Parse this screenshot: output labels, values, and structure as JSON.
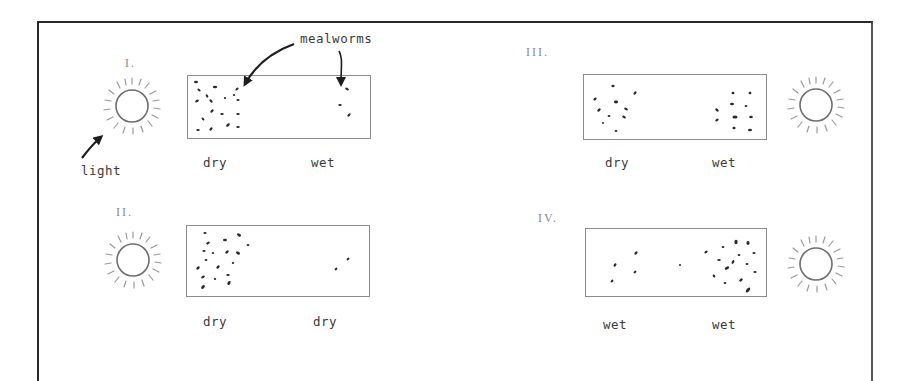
{
  "diagram": {
    "annotations": {
      "mealworms_label": "mealworms",
      "light_label": "light"
    },
    "panels": [
      {
        "id": "I",
        "numeral": "I.",
        "light_side": "left",
        "left_condition": "dry",
        "right_condition": "wet",
        "worms_left_cluster": 18,
        "worms_right_cluster": 3
      },
      {
        "id": "II",
        "numeral": "II.",
        "light_side": "left",
        "left_condition": "dry",
        "right_condition": "dry",
        "worms_left_cluster": 19,
        "worms_right_cluster": 2
      },
      {
        "id": "III",
        "numeral": "III.",
        "light_side": "right",
        "left_condition": "dry",
        "right_condition": "wet",
        "worms_left_cluster": 10,
        "worms_right_cluster": 11
      },
      {
        "id": "IV",
        "numeral": "IV.",
        "light_side": "right",
        "left_condition": "wet",
        "right_condition": "wet",
        "worms_left_cluster": 5,
        "worms_right_cluster": 18
      }
    ],
    "icons": {
      "light_source": "sun-icon",
      "pointer": "arrow-icon"
    },
    "colors": {
      "ink": "#2a2a2a",
      "chamber_border": "#8c8c8c",
      "sun_stroke": "#6e6e6e",
      "ray_stroke": "#9a9a9a",
      "background": "#ffffff"
    }
  }
}
